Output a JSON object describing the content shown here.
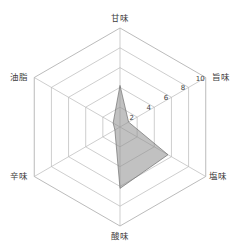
{
  "chart_data": {
    "type": "radar",
    "title": "",
    "subtitle": "",
    "xlabel": "",
    "ylabel": "",
    "grid": true,
    "legend": "none",
    "orientation": "vertex-up-hexagon",
    "rmin": 0,
    "rmax": 10,
    "rings": [
      2,
      4,
      6,
      8,
      10
    ],
    "tick_labels": [
      "2",
      "4",
      "6",
      "8",
      "10"
    ],
    "tick_axis": "旨味",
    "categories": [
      "甘味",
      "旨味",
      "塩味",
      "酸味",
      "辛味",
      "油脂"
    ],
    "category_angles_deg": [
      90,
      30,
      330,
      270,
      210,
      150
    ],
    "series": [
      {
        "name": "",
        "values": [
          4.2,
          1.0,
          5.6,
          6.2,
          0.6,
          0.8
        ]
      }
    ]
  },
  "axis_labels": {
    "top": "甘味",
    "upper_right": "旨味",
    "lower_right": "塩味",
    "bottom": "酸味",
    "lower_left": "辛味",
    "upper_left": "油脂"
  },
  "ticks": {
    "t2": "2",
    "t4": "4",
    "t6": "6",
    "t8": "8",
    "t10": "10"
  },
  "colors": {
    "series_fill": "#8e8e8e",
    "series_stroke": "#6e6e6e",
    "grid": "#b9b9b9",
    "text": "#3d3d3d",
    "background": "#ffffff"
  }
}
